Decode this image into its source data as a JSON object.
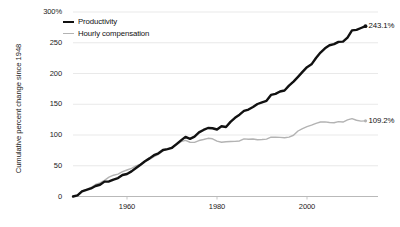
{
  "chart_data": {
    "type": "line",
    "title": "",
    "subtitle": "",
    "xlabel": "",
    "ylabel": "Cumulative percent change since 1948",
    "xlim": [
      1948,
      2014
    ],
    "ylim": [
      0,
      300
    ],
    "grid": true,
    "legend_position": "top-left",
    "y_ticks": [
      "300%",
      "250",
      "200",
      "150",
      "100",
      "50",
      "0"
    ],
    "y_tick_values": [
      300,
      250,
      200,
      150,
      100,
      50,
      0
    ],
    "x_ticks": [
      "1960",
      "1980",
      "2000"
    ],
    "x_tick_values": [
      1960,
      1980,
      2000
    ],
    "colors": {
      "productivity": "#111111",
      "compensation": "#b3b3b3",
      "gridline": "#e3e3e3",
      "axis": "#b9b9b9",
      "background": "#ffffff"
    },
    "annotations": [
      {
        "name": "productivity-end-label",
        "text": "243.1%",
        "x": 2014,
        "y": 243.1
      },
      {
        "name": "compensation-end-label",
        "text": "109.2%",
        "x": 2014,
        "y": 109.2
      }
    ],
    "x": [
      1948,
      1949,
      1950,
      1951,
      1952,
      1953,
      1954,
      1955,
      1956,
      1957,
      1958,
      1959,
      1960,
      1961,
      1962,
      1963,
      1964,
      1965,
      1966,
      1967,
      1968,
      1969,
      1970,
      1971,
      1972,
      1973,
      1974,
      1975,
      1976,
      1977,
      1978,
      1979,
      1980,
      1981,
      1982,
      1983,
      1984,
      1985,
      1986,
      1987,
      1988,
      1989,
      1990,
      1991,
      1992,
      1993,
      1994,
      1995,
      1996,
      1997,
      1998,
      1999,
      2000,
      2001,
      2002,
      2003,
      2004,
      2005,
      2006,
      2007,
      2008,
      2009,
      2010,
      2011,
      2012,
      2013,
      2014
    ],
    "series": [
      {
        "name": "Productivity",
        "color": "#111111",
        "width": 2.4,
        "values": [
          0,
          1.9,
          8.5,
          10.9,
          13.1,
          17.1,
          19.1,
          24.2,
          24.5,
          27.6,
          30.0,
          35.0,
          36.6,
          40.9,
          46.4,
          51.7,
          57.3,
          62.0,
          67.2,
          70.2,
          75.6,
          77.0,
          79.2,
          85.2,
          91.3,
          97.0,
          93.7,
          97.3,
          104.2,
          108.2,
          111.4,
          111.0,
          109.0,
          114.2,
          113.1,
          121.4,
          128.0,
          133.0,
          139.1,
          141.4,
          145.5,
          150.4,
          153.2,
          155.6,
          165.2,
          166.9,
          170.7,
          172.3,
          180.2,
          186.8,
          194.6,
          202.6,
          210.3,
          214.9,
          225.2,
          234.1,
          241.0,
          245.9,
          247.8,
          251.5,
          251.8,
          258.5,
          270.2,
          271.0,
          274.0,
          277.0,
          243.1
        ]
      },
      {
        "name": "Hourly compensation",
        "color": "#b3b3b3",
        "width": 1.4,
        "values": [
          0,
          2.0,
          9.1,
          11.7,
          14.6,
          19.5,
          22.1,
          26.3,
          31.6,
          34.6,
          36.4,
          40.3,
          43.1,
          45.8,
          49.8,
          52.6,
          57.3,
          60.5,
          64.8,
          68.6,
          74.2,
          77.0,
          80.1,
          83.9,
          89.2,
          91.3,
          88.2,
          88.0,
          91.0,
          92.6,
          94.6,
          93.8,
          90.0,
          88.3,
          89.0,
          89.5,
          89.7,
          90.3,
          93.7,
          93.0,
          93.5,
          92.2,
          92.6,
          93.3,
          96.4,
          96.4,
          96.2,
          95.5,
          96.6,
          99.6,
          106.5,
          110.5,
          113.5,
          116.1,
          119.0,
          121.2,
          121.4,
          120.4,
          120.0,
          121.8,
          121.1,
          124.5,
          126.7,
          124.0,
          122.6,
          123.0,
          109.2
        ]
      }
    ]
  },
  "legend": {
    "items": [
      {
        "label": "Productivity",
        "key": "prod"
      },
      {
        "label": "Hourly compensation",
        "key": "comp"
      }
    ]
  },
  "axis": {
    "y_title": "Cumulative percent change since 1948"
  }
}
